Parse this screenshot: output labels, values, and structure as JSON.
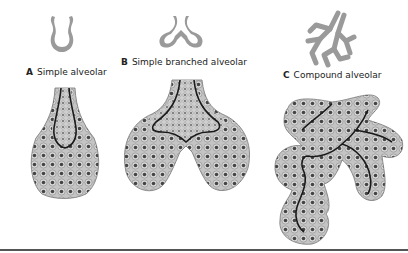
{
  "figure": {
    "panels": [
      {
        "letter": "A",
        "title": "Simple alveolar"
      },
      {
        "letter": "B",
        "title": "Simple branched alveolar"
      },
      {
        "letter": "C",
        "title": "Compound alveolar"
      }
    ]
  },
  "colors": {
    "schematic": "#9a9a9a",
    "cell_fill": "#bdbdbd",
    "nucleus": "#444444",
    "duct": "#1a1a1a",
    "rule": "#555555"
  }
}
